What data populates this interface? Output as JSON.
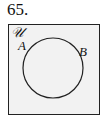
{
  "problem_number": "65.",
  "diagram": {
    "type": "venn",
    "universal_label": "𝒰",
    "set_labels": [
      "A",
      "B"
    ],
    "colors": {
      "box_fill": "#f2f2f2",
      "stroke": "#222222"
    }
  }
}
